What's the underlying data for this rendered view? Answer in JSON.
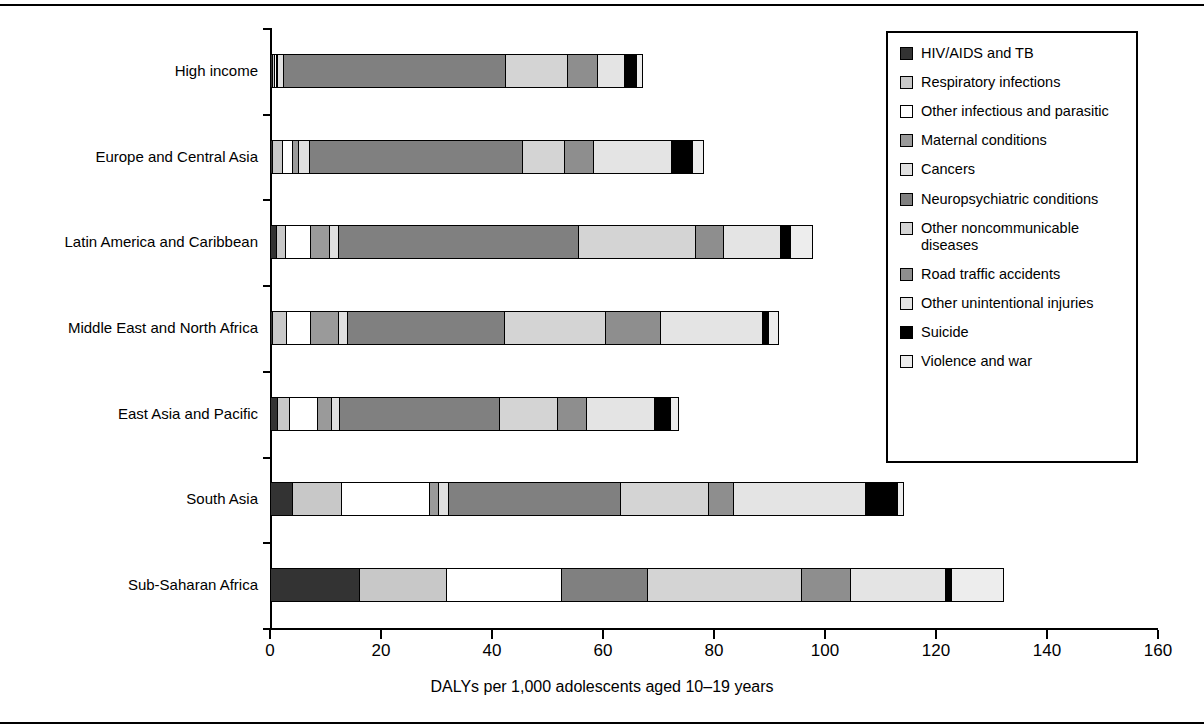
{
  "chart_data": {
    "type": "bar",
    "orientation": "horizontal",
    "stacked": true,
    "title": "",
    "xlabel": "DALYs per 1,000 adolescents aged 10–19 years",
    "ylabel": "",
    "xlim": [
      0,
      160
    ],
    "xticks": [
      0,
      20,
      40,
      60,
      80,
      100,
      120,
      140,
      160
    ],
    "grid": false,
    "legend_position": "top-right",
    "categories": [
      "High income",
      "Europe and Central Asia",
      "Latin America and Caribbean",
      "Middle East and North Africa",
      "East Asia and Pacific",
      "South Asia",
      "Sub-Saharan Africa"
    ],
    "series": [
      {
        "name": "HIV/AIDS and TB",
        "color": "#333333",
        "values": [
          0.6,
          0.6,
          1.3,
          0.5,
          1.4,
          4.2,
          16.2
        ]
      },
      {
        "name": "Respiratory infections",
        "color": "#c8c8c8",
        "values": [
          0.5,
          2.0,
          1.7,
          2.7,
          2.4,
          9.0,
          15.8
        ]
      },
      {
        "name": "Other infectious and parasitic",
        "color": "#ffffff",
        "values": [
          0.5,
          1.9,
          4.8,
          4.6,
          5.2,
          16.0,
          21.0
        ]
      },
      {
        "name": "Maternal conditions",
        "color": "#9a9a9a",
        "values": [
          0.4,
          1.2,
          3.5,
          5.1,
          2.7,
          1.8,
          0.0
        ]
      },
      {
        "name": "Cancers",
        "color": "#e0e0e0",
        "values": [
          1.2,
          2.3,
          1.9,
          1.8,
          1.7,
          1.9,
          0.0
        ]
      },
      {
        "name": "Neuropsychiatric conditions",
        "color": "#808080",
        "values": [
          40.3,
          38.5,
          43.4,
          28.5,
          29.0,
          31.2,
          15.6
        ]
      },
      {
        "name": "Other noncommunicable diseases",
        "color": "#d4d4d4",
        "values": [
          11.2,
          7.8,
          21.2,
          18.5,
          10.5,
          16.0,
          28.0
        ]
      },
      {
        "name": "Road traffic accidents",
        "color": "#8e8e8e",
        "values": [
          5.6,
          5.4,
          5.2,
          10.0,
          5.4,
          4.8,
          9.0
        ]
      },
      {
        "name": "Other unintentional injuries",
        "color": "#e4e4e4",
        "values": [
          5.2,
          14.1,
          10.6,
          18.5,
          12.6,
          24.0,
          17.2
        ]
      },
      {
        "name": "Suicide",
        "color": "#000000",
        "values": [
          2.2,
          4.0,
          1.9,
          1.3,
          3.0,
          5.8,
          1.3
        ]
      },
      {
        "name": "Violence and war",
        "color": "#ededed",
        "values": [
          1.3,
          2.2,
          4.1,
          2.1,
          1.6,
          1.3,
          9.6
        ]
      }
    ],
    "totals": [
      69.0,
      80.0,
      99.6,
      93.6,
      75.5,
      116.0,
      133.7
    ]
  },
  "legend": {
    "items": [
      {
        "label": "HIV/AIDS and TB",
        "color": "#333333"
      },
      {
        "label": "Respiratory infections",
        "color": "#c8c8c8"
      },
      {
        "label": "Other infectious and parasitic",
        "color": "#ffffff"
      },
      {
        "label": "Maternal conditions",
        "color": "#9a9a9a"
      },
      {
        "label": "Cancers",
        "color": "#e0e0e0"
      },
      {
        "label": "Neuropsychiatric conditions",
        "color": "#808080"
      },
      {
        "label": "Other noncommunicable diseases",
        "color": "#d4d4d4"
      },
      {
        "label": "Road traffic accidents",
        "color": "#8e8e8e"
      },
      {
        "label": "Other unintentional injuries",
        "color": "#e4e4e4"
      },
      {
        "label": "Suicide",
        "color": "#000000"
      },
      {
        "label": "Violence and war",
        "color": "#ededed"
      }
    ]
  }
}
